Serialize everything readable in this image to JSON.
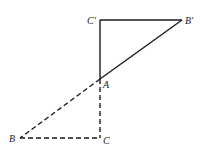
{
  "diagram": {
    "type": "geometry",
    "points": {
      "A": {
        "label": "A",
        "x": 100,
        "y": 79
      },
      "B": {
        "label": "B",
        "x": 20,
        "y": 138
      },
      "C": {
        "label": "C",
        "x": 100,
        "y": 138
      },
      "Bp": {
        "label": "B′",
        "x": 182,
        "y": 20
      },
      "Cp": {
        "label": "C′",
        "x": 100,
        "y": 20
      }
    },
    "solid_triangle": [
      "A",
      "B′",
      "C′"
    ],
    "dashed_triangle": [
      "A",
      "B",
      "C"
    ],
    "colors": {
      "stroke": "#1a1a1a",
      "background": "#ffffff"
    }
  }
}
